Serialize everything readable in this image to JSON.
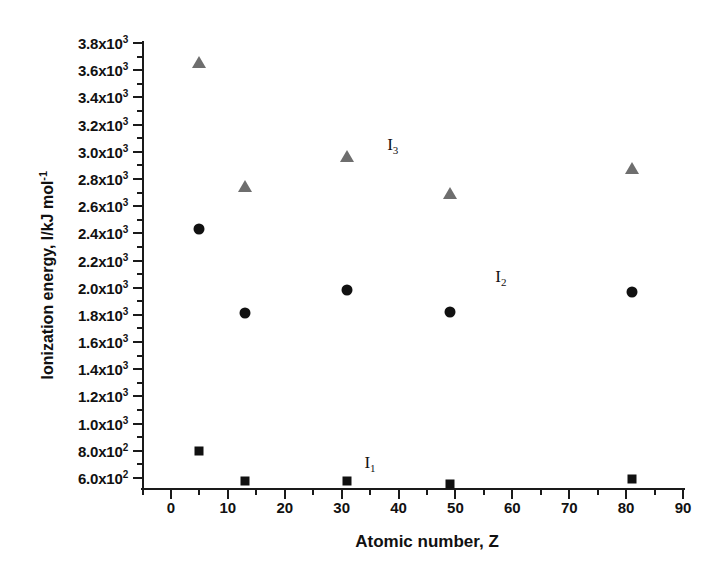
{
  "chart_data": {
    "type": "scatter",
    "title": "",
    "xlabel": "Atomic number, Z",
    "ylabel": "Ionization energy, I/kJ mol",
    "ylabel_exponent": "-1",
    "xlim": [
      0,
      90
    ],
    "ylim": [
      600,
      3800
    ],
    "grid": false,
    "legend_position": "inline-annotations",
    "x": [
      5,
      13,
      31,
      49,
      81
    ],
    "xtick_labels": [
      "0",
      "10",
      "20",
      "30",
      "40",
      "50",
      "60",
      "70",
      "80",
      "90"
    ],
    "xtick_values": [
      0,
      10,
      20,
      30,
      40,
      50,
      60,
      70,
      80,
      90
    ],
    "ytick_labels": [
      "6.0x10|2",
      "8.0x10|2",
      "1.0x10|3",
      "1.2x10|3",
      "1.4x10|3",
      "1.6x10|3",
      "1.8x10|3",
      "2.0x10|3",
      "2.2x10|3",
      "2.4x10|3",
      "2.6x10|3",
      "2.8x10|3",
      "3.0x10|3",
      "3.2x10|3",
      "3.4x10|3",
      "3.6x10|3",
      "3.8x10|3"
    ],
    "ytick_values": [
      600,
      800,
      1000,
      1200,
      1400,
      1600,
      1800,
      2000,
      2200,
      2400,
      2600,
      2800,
      3000,
      3200,
      3400,
      3600,
      3800
    ],
    "series": [
      {
        "name": "I1",
        "label": "I",
        "sub": "1",
        "marker": "square",
        "color": "#111111",
        "values": [
          800,
          578,
          579,
          558,
          589
        ],
        "label_x": 34,
        "label_y": 700
      },
      {
        "name": "I2",
        "label": "I",
        "sub": "2",
        "marker": "circle",
        "color": "#111111",
        "values": [
          2430,
          1815,
          1980,
          1820,
          1970
        ],
        "label_x": 57,
        "label_y": 2070
      },
      {
        "name": "I3",
        "label": "I",
        "sub": "3",
        "marker": "triangle",
        "color": "#6e6e6e",
        "values": [
          3660,
          2745,
          2970,
          2700,
          2880
        ],
        "label_x": 38,
        "label_y": 3040
      }
    ]
  }
}
